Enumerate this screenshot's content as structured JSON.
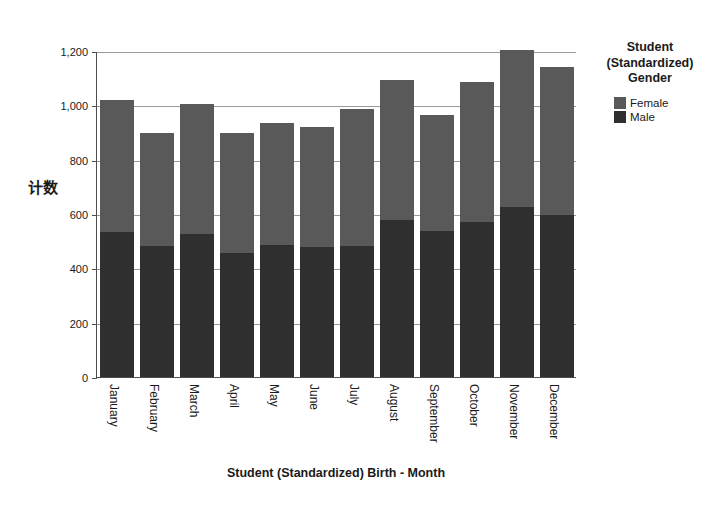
{
  "chart_data": {
    "type": "bar",
    "subtype": "stacked-vertical",
    "title": "",
    "xlabel": "Student (Standardized) Birth - Month",
    "ylabel": "计数",
    "categories": [
      "January",
      "February",
      "March",
      "April",
      "May",
      "June",
      "July",
      "August",
      "September",
      "October",
      "November",
      "December"
    ],
    "series": [
      {
        "name": "Male",
        "color": "#2f2f2f",
        "values": [
          535,
          483,
          527,
          458,
          487,
          480,
          483,
          578,
          538,
          570,
          625,
          598
        ]
      },
      {
        "name": "Female",
        "color": "#595959",
        "values": [
          485,
          417,
          478,
          440,
          448,
          440,
          502,
          517,
          425,
          515,
          578,
          545
        ]
      }
    ],
    "totals": [
      1020,
      900,
      1005,
      898,
      935,
      920,
      985,
      1095,
      963,
      1085,
      1203,
      1143
    ],
    "ylim": [
      0,
      1200
    ],
    "yticks": [
      0,
      200,
      400,
      600,
      800,
      1000,
      1200
    ],
    "ytick_labels": [
      "0",
      "200",
      "400",
      "600",
      "800",
      "1,000",
      "1,200"
    ],
    "grid": "horizontal",
    "legend_position": "right",
    "legend_title": "Student (Standardized) Gender"
  },
  "legend": {
    "title_lines": [
      "Student",
      "(Standardized)",
      "Gender"
    ],
    "entries": [
      {
        "label": "Female",
        "color": "#595959"
      },
      {
        "label": "Male",
        "color": "#2f2f2f"
      }
    ]
  },
  "axes": {
    "y_title": "计数",
    "x_title": "Student (Standardized) Birth - Month"
  }
}
